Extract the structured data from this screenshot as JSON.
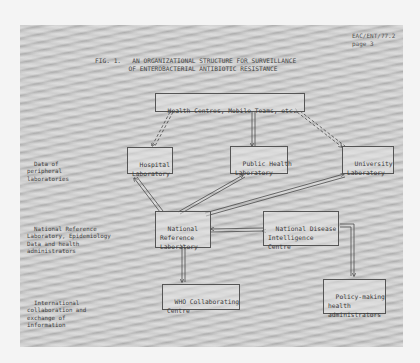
{
  "document": {
    "reference": "EAC/ENT/77.2",
    "page": "page 3",
    "figure_label": "FIG. 1.",
    "title_line1": "AN ORGANIZATIONAL STRUCTURE FOR SURVEILLANCE",
    "title_line2": "OF ENTEROBACTERIAL ANTIBIOTIC RESISTANCE"
  },
  "side_labels": [
    {
      "text": "Data of\nperipheral\nlaboratories"
    },
    {
      "text": "National Reference\nLaboratory, Epidemiology\nData and health\nadministrators"
    },
    {
      "text": "International\ncollaboration and\nexchange of\ninformation"
    }
  ],
  "nodes": {
    "health_centres": "Health Centres, Mobile Teams, etc.",
    "hospital_lab": "Hospital\nLaboratory",
    "public_health_lab": "Public Health\nLaboratory",
    "university_lab": "University\nLaboratory",
    "national_reference_lab": "National\nReference\nLaboratory",
    "national_disease_centre": "National Disease\nIntelligence\nCentre",
    "who_centre": "WHO Collaborating\nCentre",
    "policy_makers": "Policy-making\nhealth\nadministrators"
  },
  "edges": [
    {
      "from": "health_centres",
      "to": "hospital_lab",
      "style": "dashed-double",
      "direction": "both"
    },
    {
      "from": "health_centres",
      "to": "public_health_lab",
      "style": "double",
      "direction": "to"
    },
    {
      "from": "health_centres",
      "to": "university_lab",
      "style": "dashed-double",
      "direction": "both"
    },
    {
      "from": "national_reference_lab",
      "to": "hospital_lab",
      "style": "double",
      "direction": "to"
    },
    {
      "from": "national_reference_lab",
      "to": "public_health_lab",
      "style": "double",
      "direction": "to"
    },
    {
      "from": "national_reference_lab",
      "to": "university_lab",
      "style": "double",
      "direction": "to"
    },
    {
      "from": "national_disease_centre",
      "to": "national_reference_lab",
      "style": "double",
      "direction": "both"
    },
    {
      "from": "national_reference_lab",
      "to": "who_centre",
      "style": "double",
      "direction": "both"
    },
    {
      "from": "national_disease_centre",
      "to": "policy_makers",
      "style": "elbow-double",
      "direction": "to"
    }
  ]
}
